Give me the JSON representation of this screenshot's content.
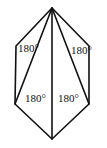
{
  "figure": {
    "vertices": [
      "top",
      "upper-left",
      "lower-left",
      "bottom",
      "lower-right",
      "upper-right"
    ],
    "diagonals": [
      [
        "top",
        "lower-left"
      ],
      [
        "top",
        "bottom"
      ],
      [
        "top",
        "lower-right"
      ]
    ],
    "triangle_labels": [
      {
        "triangle": "left",
        "text": "180°"
      },
      {
        "triangle": "right",
        "text": "180°"
      },
      {
        "triangle": "inner-left",
        "text": "180°"
      },
      {
        "triangle": "inner-right",
        "text": "180°"
      }
    ]
  }
}
